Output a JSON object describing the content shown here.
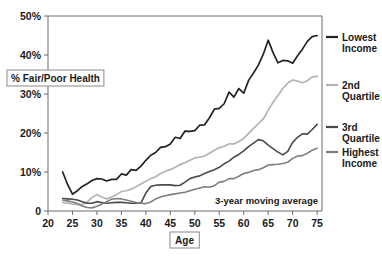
{
  "chart_data": {
    "type": "line",
    "title": "",
    "subtitle": "",
    "xlabel": "Age",
    "ylabel": "% Fair/Poor Health",
    "xlim": [
      20,
      76
    ],
    "ylim": [
      0,
      50
    ],
    "grid": false,
    "legend_position": "right",
    "annotations": [
      "3-year moving average"
    ],
    "xticks": [
      20,
      25,
      30,
      35,
      40,
      45,
      50,
      55,
      60,
      65,
      70,
      75
    ],
    "xtick_labels": [
      "20",
      "25",
      "30",
      "35",
      "40",
      "45",
      "50",
      "55",
      "60",
      "65",
      "70",
      "75"
    ],
    "yticks": [
      0,
      10,
      20,
      30,
      40,
      50
    ],
    "ytick_labels": [
      "0",
      "10%",
      "20%",
      "30%",
      "40%",
      "50%"
    ],
    "series": [
      {
        "name": "Lowest Income",
        "color": "#232323",
        "width": 1.7,
        "x": [
          23,
          24,
          25,
          26,
          27,
          28,
          29,
          30,
          31,
          32,
          33,
          34,
          35,
          36,
          37,
          38,
          39,
          40,
          41,
          42,
          43,
          44,
          45,
          46,
          47,
          48,
          49,
          50,
          51,
          52,
          53,
          54,
          55,
          56,
          57,
          58,
          59,
          60,
          61,
          62,
          63,
          64,
          65,
          66,
          67,
          68,
          69,
          70,
          71,
          72,
          73,
          74,
          75
        ],
        "values": [
          10.0,
          6.8,
          4.3,
          5.2,
          6.3,
          7.0,
          7.8,
          8.3,
          8.2,
          7.7,
          8.1,
          8.1,
          9.5,
          9.2,
          10.6,
          10.4,
          11.5,
          13.0,
          14.3,
          15.0,
          16.3,
          16.5,
          17.2,
          18.9,
          18.6,
          20.5,
          20.4,
          20.6,
          22.0,
          22.1,
          23.9,
          26.1,
          26.3,
          27.5,
          30.5,
          29.2,
          31.4,
          30.2,
          33.5,
          35.4,
          37.4,
          40.2,
          43.8,
          40.6,
          38.0,
          38.6,
          38.5,
          37.9,
          39.8,
          41.5,
          43.5,
          44.7,
          45.0
        ]
      },
      {
        "name": "2nd Quartile",
        "color": "#b4b4b4",
        "width": 1.7,
        "x": [
          23,
          24,
          25,
          26,
          27,
          28,
          29,
          30,
          31,
          32,
          33,
          34,
          35,
          36,
          37,
          38,
          39,
          40,
          41,
          42,
          43,
          44,
          45,
          46,
          47,
          48,
          49,
          50,
          51,
          52,
          53,
          54,
          55,
          56,
          57,
          58,
          59,
          60,
          61,
          62,
          63,
          64,
          65,
          66,
          67,
          68,
          69,
          70,
          71,
          72,
          73,
          74,
          75
        ],
        "values": [
          2.2,
          2.0,
          1.8,
          1.6,
          1.7,
          2.3,
          3.5,
          4.2,
          3.6,
          3.1,
          3.6,
          4.2,
          5.0,
          5.2,
          5.6,
          6.2,
          6.9,
          7.6,
          8.3,
          8.8,
          9.6,
          10.2,
          10.6,
          11.2,
          11.9,
          12.4,
          13.0,
          13.6,
          13.8,
          14.1,
          14.8,
          15.6,
          16.2,
          16.6,
          17.2,
          17.2,
          17.8,
          18.6,
          19.9,
          21.2,
          22.4,
          23.6,
          25.8,
          27.9,
          29.6,
          31.4,
          32.8,
          33.6,
          33.3,
          32.9,
          33.4,
          34.4,
          34.5
        ]
      },
      {
        "name": "3rd Quartile",
        "color": "#4a4a4a",
        "width": 1.6,
        "x": [
          23,
          24,
          25,
          26,
          27,
          28,
          29,
          30,
          31,
          32,
          33,
          34,
          35,
          36,
          37,
          38,
          39,
          40,
          41,
          42,
          43,
          44,
          45,
          46,
          47,
          48,
          49,
          50,
          51,
          52,
          53,
          54,
          55,
          56,
          57,
          58,
          59,
          60,
          61,
          62,
          63,
          64,
          65,
          66,
          67,
          68,
          69,
          70,
          71,
          72,
          73,
          74,
          75
        ],
        "values": [
          3.2,
          3.1,
          3.0,
          2.8,
          2.4,
          2.0,
          2.0,
          2.4,
          2.2,
          2.0,
          2.1,
          2.2,
          2.2,
          2.1,
          2.0,
          2.0,
          2.1,
          4.6,
          6.3,
          6.6,
          6.7,
          6.7,
          6.7,
          6.5,
          6.6,
          7.4,
          8.3,
          8.7,
          9.0,
          9.6,
          10.1,
          10.6,
          11.2,
          12.1,
          12.8,
          13.8,
          14.5,
          15.4,
          16.5,
          17.4,
          18.3,
          18.0,
          16.9,
          16.0,
          15.1,
          14.4,
          15.3,
          17.6,
          18.9,
          19.8,
          19.7,
          20.9,
          22.2
        ]
      },
      {
        "name": "Highest Income",
        "color": "#7e7e7e",
        "width": 1.6,
        "x": [
          23,
          24,
          25,
          26,
          27,
          28,
          29,
          30,
          31,
          32,
          33,
          34,
          35,
          36,
          37,
          38,
          39,
          40,
          41,
          42,
          43,
          44,
          45,
          46,
          47,
          48,
          49,
          50,
          51,
          52,
          53,
          54,
          55,
          56,
          57,
          58,
          59,
          60,
          61,
          62,
          63,
          64,
          65,
          66,
          67,
          68,
          69,
          70,
          71,
          72,
          73,
          74,
          75
        ],
        "values": [
          2.8,
          2.6,
          2.3,
          1.9,
          1.3,
          0.9,
          0.8,
          1.2,
          1.8,
          2.4,
          3.0,
          3.2,
          3.1,
          2.8,
          2.5,
          2.2,
          2.0,
          1.9,
          2.3,
          3.1,
          3.6,
          3.9,
          4.2,
          4.4,
          4.6,
          4.8,
          5.2,
          5.6,
          5.9,
          6.2,
          6.1,
          6.5,
          7.4,
          7.6,
          8.3,
          8.3,
          8.9,
          9.6,
          9.9,
          10.4,
          10.6,
          11.1,
          11.8,
          11.9,
          12.0,
          12.2,
          12.5,
          13.5,
          14.1,
          14.2,
          14.8,
          15.6,
          16.1
        ]
      }
    ]
  },
  "axis": {
    "y_axis_boxed_label": "% Fair/Poor Health",
    "x_axis_boxed_label": "Age"
  },
  "legend": {
    "entries": [
      {
        "label_line1": "Lowest",
        "label_line2": "Income",
        "color": "#232323"
      },
      {
        "label_line1": "2nd",
        "label_line2": "Quartile",
        "color": "#b4b4b4"
      },
      {
        "label_line1": "3rd",
        "label_line2": "Quartile",
        "color": "#4a4a4a"
      },
      {
        "label_line1": "Highest",
        "label_line2": "Income",
        "color": "#7e7e7e"
      }
    ]
  },
  "annotation": {
    "moving_average": "3-year moving average"
  },
  "colors": {
    "frame": "#6d6d6d",
    "text": "#1a1a1a",
    "background": "#ffffff"
  }
}
